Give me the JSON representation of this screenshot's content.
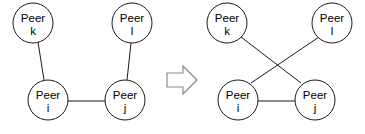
{
  "diagram": {
    "type": "network-topology-transformation",
    "arrow": {
      "name": "transformation-arrow",
      "direction": "right",
      "color": "#8a8a8a"
    },
    "style": {
      "node_fill": "#ffffff",
      "node_stroke": "#1a1a1a",
      "edge_stroke": "#1a1a1a",
      "text_color": "#000000",
      "background": "#ffffff",
      "node_radius": 20
    },
    "before": {
      "name": "before-topology",
      "nodes": [
        {
          "id": "k",
          "label": "Peer",
          "sub": "k",
          "cx": 33,
          "cy": 23
        },
        {
          "id": "l",
          "label": "Peer",
          "sub": "l",
          "cx": 132,
          "cy": 23
        },
        {
          "id": "i",
          "label": "Peer",
          "sub": "i",
          "cx": 48,
          "cy": 100
        },
        {
          "id": "j",
          "label": "Peer",
          "sub": "j",
          "cx": 125,
          "cy": 100
        }
      ],
      "edges": [
        {
          "from": "k",
          "to": "i"
        },
        {
          "from": "l",
          "to": "j"
        },
        {
          "from": "i",
          "to": "j"
        }
      ]
    },
    "after": {
      "name": "after-topology",
      "nodes": [
        {
          "id": "k",
          "label": "Peer",
          "sub": "k",
          "cx": 227,
          "cy": 23
        },
        {
          "id": "l",
          "label": "Peer",
          "sub": "l",
          "cx": 332,
          "cy": 23
        },
        {
          "id": "i",
          "label": "Peer",
          "sub": "i",
          "cx": 238,
          "cy": 100
        },
        {
          "id": "j",
          "label": "Peer",
          "sub": "j",
          "cx": 315,
          "cy": 100
        }
      ],
      "edges": [
        {
          "from": "k",
          "to": "j"
        },
        {
          "from": "l",
          "to": "i"
        },
        {
          "from": "i",
          "to": "j"
        }
      ]
    }
  }
}
